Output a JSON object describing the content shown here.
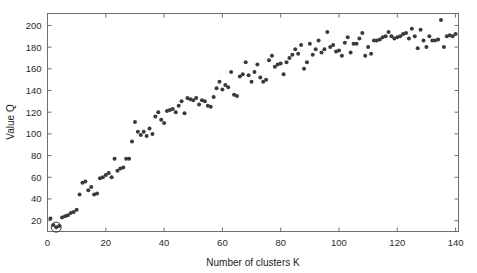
{
  "chart_data": {
    "type": "scatter",
    "title": "",
    "xlabel": "Number of clusters K",
    "ylabel": "Value Q",
    "xlim": [
      0,
      141
    ],
    "ylim": [
      10,
      211
    ],
    "grid": false,
    "legend": null,
    "xticks": [
      0,
      20,
      40,
      60,
      80,
      100,
      120,
      140
    ],
    "xtick_labels": [
      "0",
      "20",
      "40",
      "60",
      "80",
      "100",
      "120",
      "140"
    ],
    "yticks": [
      20,
      40,
      60,
      80,
      100,
      120,
      140,
      160,
      180,
      200
    ],
    "ytick_labels": [
      "20",
      "40",
      "60",
      "80",
      "100",
      "120",
      "140",
      "160",
      "180",
      "200"
    ],
    "marker": "dot",
    "marker_color": "#3a3a3a",
    "marker_size": 2.0,
    "series": [
      {
        "name": "Q values",
        "x": [
          1,
          2,
          3,
          4,
          5,
          6,
          7,
          8,
          9,
          10,
          11,
          12,
          13,
          14,
          15,
          16,
          17,
          18,
          19,
          20,
          21,
          22,
          23,
          24,
          25,
          26,
          27,
          28,
          29,
          30,
          31,
          32,
          33,
          34,
          35,
          36,
          37,
          38,
          39,
          40,
          41,
          42,
          43,
          44,
          45,
          46,
          47,
          48,
          49,
          50,
          51,
          52,
          53,
          54,
          55,
          56,
          57,
          58,
          59,
          60,
          61,
          62,
          63,
          64,
          65,
          66,
          67,
          68,
          69,
          70,
          71,
          72,
          73,
          74,
          75,
          76,
          77,
          78,
          79,
          80,
          81,
          82,
          83,
          84,
          85,
          86,
          87,
          88,
          89,
          90,
          91,
          92,
          93,
          94,
          95,
          96,
          97,
          98,
          99,
          100,
          101,
          102,
          103,
          104,
          105,
          106,
          107,
          108,
          109,
          110,
          111,
          112,
          113,
          114,
          115,
          116,
          117,
          118,
          119,
          120,
          121,
          122,
          123,
          124,
          125,
          126,
          127,
          128,
          129,
          130,
          131,
          132,
          133,
          134,
          135,
          136,
          137,
          138,
          139,
          140
        ],
        "y": [
          22,
          16,
          14,
          15,
          23,
          24,
          25,
          27,
          28,
          30,
          44,
          55,
          56,
          48,
          51,
          44,
          45,
          59,
          60,
          62,
          64,
          60,
          77,
          66,
          68,
          69,
          77,
          77,
          93,
          111,
          102,
          99,
          102,
          98,
          105,
          100,
          116,
          120,
          113,
          110,
          121,
          122,
          123,
          120,
          126,
          130,
          119,
          133,
          132,
          131,
          133,
          127,
          131,
          130,
          126,
          125,
          134,
          142,
          148,
          141,
          145,
          143,
          157,
          136,
          135,
          153,
          155,
          166,
          154,
          148,
          157,
          164,
          152,
          148,
          150,
          168,
          172,
          162,
          164,
          165,
          155,
          166,
          170,
          173,
          178,
          174,
          182,
          160,
          166,
          183,
          173,
          178,
          186,
          175,
          178,
          194,
          180,
          182,
          176,
          177,
          172,
          184,
          189,
          175,
          183,
          183,
          188,
          193,
          172,
          180,
          174,
          186,
          186,
          187,
          189,
          190,
          194,
          190,
          188,
          189,
          190,
          192,
          193,
          188,
          197,
          190,
          179,
          196,
          186,
          180,
          190,
          186,
          186,
          187,
          205,
          180,
          190,
          191,
          190,
          192
        ]
      }
    ],
    "annotations": [
      {
        "name": "highlighted-minimum-point",
        "x": 3,
        "y": 14,
        "marker": "circle-ring",
        "radius_px": 5
      }
    ]
  },
  "axes": {
    "x_title": "Number of clusters K",
    "y_title": "Value Q"
  }
}
